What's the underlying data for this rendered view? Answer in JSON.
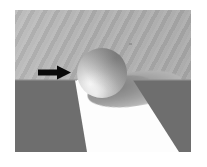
{
  "figure": {
    "canvas": {
      "width": 207,
      "height": 167,
      "background": "#ffffff"
    },
    "render_area": {
      "x": 15,
      "y": 10,
      "width": 176,
      "height": 142
    }
  },
  "palette": {
    "page_background": "#ffffff",
    "wall_gray": "#b2b2b2",
    "wall_gray_light": "#bcbcbc",
    "wall_gray_dark": "#a9a9a9",
    "groove_dark_gray": "#6e6e6e",
    "floor_white": "#fdfdfd",
    "shadow_gray": "#8e8e8e",
    "sphere_highlight": "#f4f4f4",
    "sphere_shadow": "#757575",
    "arrow_black": "#0a0a0a"
  },
  "elements": {
    "background_wall": {
      "label": "background-wall",
      "fill": "#b2b2b2",
      "texture": "diagonal-banding",
      "band_angle_deg": 118
    },
    "floor_plane": {
      "label": "floor-plane",
      "fill": "#fdfdfd"
    },
    "groove_left": {
      "label": "groove-left-wedge",
      "fill": "#6e6e6e"
    },
    "groove_right": {
      "label": "groove-right-wedge",
      "fill": "#6e6e6e"
    },
    "sphere": {
      "label": "sphere",
      "center": {
        "x": 87,
        "y": 63
      },
      "radius": 25,
      "highlight_position": "lower-left",
      "highlight_color": "#f4f4f4",
      "terminator_color": "#757575"
    },
    "cast_shadow": {
      "label": "cast-shadow-ellipse",
      "fill": "#8e8e8e",
      "rotation_deg": -9
    },
    "arrow": {
      "label": "annotation-arrow",
      "direction": "right",
      "color": "#0a0a0a",
      "points_at": "sphere"
    }
  }
}
